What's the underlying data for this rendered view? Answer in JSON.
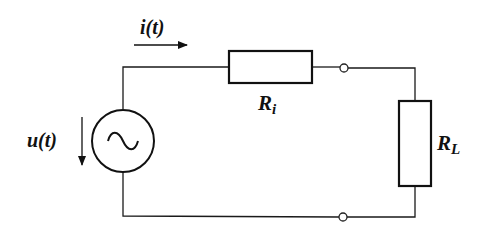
{
  "diagram": {
    "type": "circuit",
    "title": "",
    "background": "#ffffff",
    "line_color": "#111111",
    "labels": {
      "current": "i(t)",
      "voltage": "u(t)",
      "internal_resistor": "R",
      "internal_resistor_sub": "i",
      "load_resistor": "R",
      "load_resistor_sub": "L"
    },
    "components": [
      {
        "id": "source",
        "kind": "ac-voltage-source",
        "symbol": "~",
        "label": "u(t)"
      },
      {
        "id": "Ri",
        "kind": "resistor",
        "label": "Ri"
      },
      {
        "id": "RL",
        "kind": "resistor",
        "label": "RL"
      },
      {
        "id": "terminal-top",
        "kind": "terminal"
      },
      {
        "id": "terminal-bottom",
        "kind": "terminal"
      }
    ],
    "connections": [
      [
        "source",
        "Ri"
      ],
      [
        "Ri",
        "terminal-top"
      ],
      [
        "terminal-top",
        "RL"
      ],
      [
        "RL",
        "terminal-bottom"
      ],
      [
        "terminal-bottom",
        "source"
      ]
    ]
  }
}
